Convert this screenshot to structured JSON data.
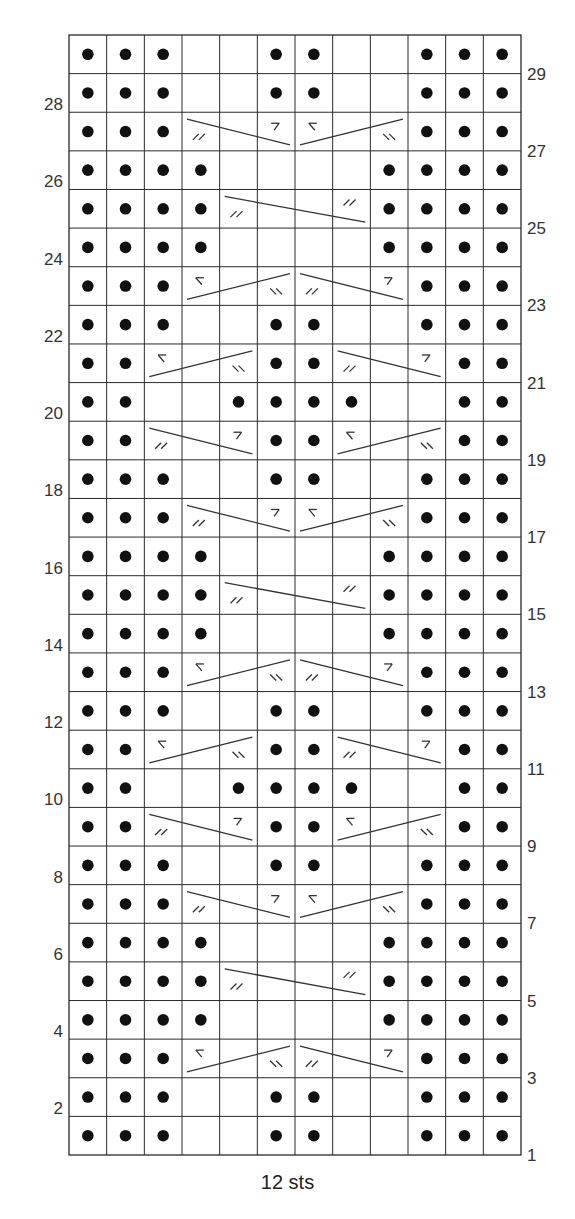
{
  "chart": {
    "title": "",
    "footer_label": "12 sts",
    "columns": 12,
    "rows": 29,
    "colors": {
      "grid": "#2a2a2a",
      "purl_dot": "#111111",
      "cable_line": "#333333",
      "label": "#333333"
    },
    "legend_symbols": {
      "P": "purl (dot)",
      "_": "knit (blank)",
      "LT_2_1": "cable crossing left (// mark start, 7 mark end)",
      "RT_2_1": "cable crossing right (< mark start, \\\\ mark end)"
    },
    "left_labels": [
      28,
      26,
      24,
      22,
      20,
      18,
      16,
      14,
      12,
      10,
      8,
      6,
      4,
      2
    ],
    "right_labels": [
      29,
      27,
      25,
      23,
      21,
      19,
      17,
      15,
      13,
      11,
      9,
      7,
      5,
      3,
      1
    ]
  },
  "chart_data": {
    "type": "table",
    "xlabel": "12 sts",
    "ylabel": "Rows",
    "row_numbering": "Row 1 at bottom; odd rows labeled right, even rows labeled left",
    "rows": {
      "29": "PPP__PP__PPP",
      "28": "PPP__PP__PPP",
      "27": "PPP______PPP",
      "26": "PPPP____PPPP",
      "25": "PPPP____PPPP",
      "24": "PPPP____PPPP",
      "23": "PPP______PPP",
      "22": "PPP__PP__PPP",
      "21": "PP___PP___PP",
      "20": "PP__PPPP__PP",
      "19": "PP___PP___PP",
      "18": "PPP__PP__PPP",
      "17": "PPP______PPP",
      "16": "PPPP____PPPP",
      "15": "PPPP____PPPP",
      "14": "PPPP____PPPP",
      "13": "PPP______PPP",
      "12": "PPP__PP__PPP",
      "11": "PP___PP___PP",
      "10": "PP__PPPP__PP",
      "9": "PP___PP___PP",
      "8": "PPP__PP__PPP",
      "7": "PPP______PPP",
      "6": "PPPP____PPPP",
      "5": "PPPP____PPPP",
      "4": "PPPP____PPPP",
      "3": "PPP______PPP",
      "2": "PPP__PP__PPP",
      "1": "PPP__PP__PPP"
    },
    "cables": [
      {
        "row": 27,
        "from": 4,
        "to": 6,
        "dir": "down",
        "start_mark": "//",
        "end_mark": "7"
      },
      {
        "row": 27,
        "from": 7,
        "to": 9,
        "dir": "up",
        "start_mark": "<",
        "end_mark": "\\\\"
      },
      {
        "row": 25,
        "from": 5,
        "to": 8,
        "dir": "down",
        "start_mark": "//",
        "end_mark": "//"
      },
      {
        "row": 23,
        "from": 4,
        "to": 6,
        "dir": "up",
        "start_mark": "<",
        "end_mark": "\\\\"
      },
      {
        "row": 23,
        "from": 7,
        "to": 9,
        "dir": "down",
        "start_mark": "//",
        "end_mark": "7"
      },
      {
        "row": 21,
        "from": 3,
        "to": 5,
        "dir": "up",
        "start_mark": "<",
        "end_mark": "\\\\"
      },
      {
        "row": 21,
        "from": 8,
        "to": 10,
        "dir": "down",
        "start_mark": "//",
        "end_mark": "7"
      },
      {
        "row": 19,
        "from": 3,
        "to": 5,
        "dir": "down",
        "start_mark": "//",
        "end_mark": "7"
      },
      {
        "row": 19,
        "from": 8,
        "to": 10,
        "dir": "up",
        "start_mark": "<",
        "end_mark": "\\\\"
      },
      {
        "row": 17,
        "from": 4,
        "to": 6,
        "dir": "down",
        "start_mark": "//",
        "end_mark": "7"
      },
      {
        "row": 17,
        "from": 7,
        "to": 9,
        "dir": "up",
        "start_mark": "<",
        "end_mark": "\\\\"
      },
      {
        "row": 15,
        "from": 5,
        "to": 8,
        "dir": "down",
        "start_mark": "//",
        "end_mark": "//"
      },
      {
        "row": 13,
        "from": 4,
        "to": 6,
        "dir": "up",
        "start_mark": "<",
        "end_mark": "\\\\"
      },
      {
        "row": 13,
        "from": 7,
        "to": 9,
        "dir": "down",
        "start_mark": "//",
        "end_mark": "7"
      },
      {
        "row": 11,
        "from": 3,
        "to": 5,
        "dir": "up",
        "start_mark": "<",
        "end_mark": "\\\\"
      },
      {
        "row": 11,
        "from": 8,
        "to": 10,
        "dir": "down",
        "start_mark": "//",
        "end_mark": "7"
      },
      {
        "row": 9,
        "from": 3,
        "to": 5,
        "dir": "down",
        "start_mark": "//",
        "end_mark": "7"
      },
      {
        "row": 9,
        "from": 8,
        "to": 10,
        "dir": "up",
        "start_mark": "<",
        "end_mark": "\\\\"
      },
      {
        "row": 7,
        "from": 4,
        "to": 6,
        "dir": "down",
        "start_mark": "//",
        "end_mark": "7"
      },
      {
        "row": 7,
        "from": 7,
        "to": 9,
        "dir": "up",
        "start_mark": "<",
        "end_mark": "\\\\"
      },
      {
        "row": 5,
        "from": 5,
        "to": 8,
        "dir": "down",
        "start_mark": "//",
        "end_mark": "//"
      },
      {
        "row": 3,
        "from": 4,
        "to": 6,
        "dir": "up",
        "start_mark": "<",
        "end_mark": "\\\\"
      },
      {
        "row": 3,
        "from": 7,
        "to": 9,
        "dir": "down",
        "start_mark": "//",
        "end_mark": "7"
      }
    ]
  }
}
